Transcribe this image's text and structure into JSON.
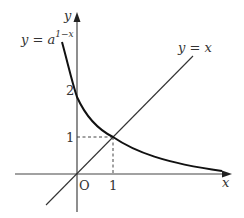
{
  "diagram": {
    "axes": {
      "x_label": "x",
      "y_label": "y",
      "origin_label": "O"
    },
    "ticks": {
      "x_one": "1",
      "y_one": "1",
      "y_two": "2"
    },
    "curves": [
      {
        "name": "exponential",
        "label_base": "y = a",
        "label_exponent": "1−x"
      },
      {
        "name": "identity",
        "label": "y = x"
      }
    ],
    "intersection_point": [
      1,
      1
    ],
    "y_intercept": 2,
    "colors": {
      "curve": "#111111",
      "line": "#333333",
      "axis": "#444444",
      "text": "#333333"
    }
  }
}
